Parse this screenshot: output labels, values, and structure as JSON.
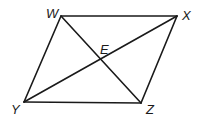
{
  "diagram": {
    "title": "",
    "shape": "parallelogram",
    "vertices": [
      {
        "name": "W",
        "x": 61,
        "y": 16
      },
      {
        "name": "X",
        "x": 177,
        "y": 16
      },
      {
        "name": "Z",
        "x": 141,
        "y": 103
      },
      {
        "name": "Y",
        "x": 24,
        "y": 102
      }
    ],
    "sides": [
      [
        "W",
        "X"
      ],
      [
        "X",
        "Z"
      ],
      [
        "Z",
        "Y"
      ],
      [
        "Y",
        "W"
      ]
    ],
    "diagonals": [
      [
        "W",
        "Z"
      ],
      [
        "X",
        "Y"
      ]
    ],
    "intersection": {
      "name": "E",
      "x": 101,
      "y": 60
    },
    "labels": {
      "W": "W",
      "X": "X",
      "Y": "Y",
      "Z": "Z",
      "E": "E"
    },
    "line_color": "#1a1a1a"
  }
}
